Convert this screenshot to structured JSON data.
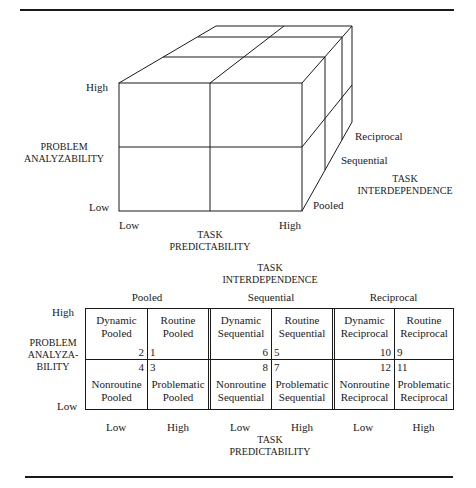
{
  "cube": {
    "y_axis": {
      "title_line1": "PROBLEM",
      "title_line2": "ANALYZABILITY",
      "high": "High",
      "low": "Low"
    },
    "x_axis": {
      "title_line1": "TASK",
      "title_line2": "PREDICTABILITY",
      "low": "Low",
      "high": "High"
    },
    "z_axis": {
      "title_line1": "TASK",
      "title_line2": "INTERDEPENDENCE",
      "levels": [
        "Pooled",
        "Sequential",
        "Reciprocal"
      ]
    }
  },
  "table": {
    "header_title_line1": "TASK",
    "header_title_line2": "INTERDEPENDENCE",
    "groups": [
      "Pooled",
      "Sequential",
      "Reciprocal"
    ],
    "row_axis": {
      "title_line1": "PROBLEM",
      "title_line2": "ANALYZA-",
      "title_line3": "BILITY",
      "high": "High",
      "low": "Low"
    },
    "col_axis": {
      "labels": [
        "Low",
        "High",
        "Low",
        "High",
        "Low",
        "High"
      ],
      "title_line1": "TASK",
      "title_line2": "PREDICTABILITY"
    },
    "cells": [
      {
        "line1": "Dynamic",
        "line2": "Pooled",
        "num": "2"
      },
      {
        "line1": "Routine",
        "line2": "Pooled",
        "num": "1"
      },
      {
        "line1": "Dynamic",
        "line2": "Sequential",
        "num": "6"
      },
      {
        "line1": "Routine",
        "line2": "Sequential",
        "num": "5"
      },
      {
        "line1": "Dynamic",
        "line2": "Reciprocal",
        "num": "10"
      },
      {
        "line1": "Routine",
        "line2": "Reciprocal",
        "num": "9"
      },
      {
        "line1": "Nonroutine",
        "line2": "Pooled",
        "num": "4"
      },
      {
        "line1": "Problematic",
        "line2": "Pooled",
        "num": "3"
      },
      {
        "line1": "Nonroutine",
        "line2": "Sequential",
        "num": "8"
      },
      {
        "line1": "Problematic",
        "line2": "Sequential",
        "num": "7"
      },
      {
        "line1": "Nonroutine",
        "line2": "Reciprocal",
        "num": "12"
      },
      {
        "line1": "Problematic",
        "line2": "Reciprocal",
        "num": "11"
      }
    ]
  }
}
